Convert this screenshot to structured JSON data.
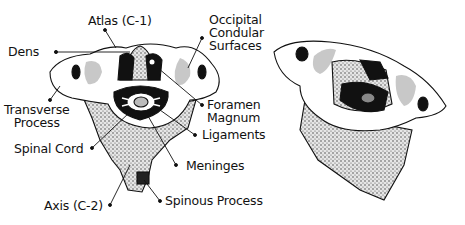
{
  "figure": {
    "type": "anatomical-illustration",
    "views": [
      "labeled view",
      "unlabeled oblique view"
    ]
  },
  "labels": {
    "atlas": "Atlas (C-1)",
    "dens": "Dens",
    "occipital": [
      "Occipital",
      "Condular",
      "Surfaces"
    ],
    "transverse": [
      "Transverse",
      "Process"
    ],
    "foramen": [
      "Foramen",
      "Magnum"
    ],
    "spinal_cord": "Spinal Cord",
    "ligaments": "Ligaments",
    "meninges": "Meninges",
    "axis": "Axis (C-2)",
    "spinous": "Spinous Process"
  },
  "colors": {
    "ink": "#111111",
    "bone_fill": "#ffffff",
    "shade": "#c8c8c8",
    "stipple": "#9a9a9a"
  }
}
